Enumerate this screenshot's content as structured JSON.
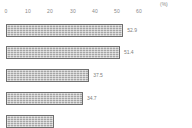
{
  "chart_data": {
    "type": "bar",
    "orientation": "horizontal",
    "title": "",
    "xlabel": "",
    "ylabel": "",
    "unit_label": "(%)",
    "xlim": [
      0,
      60
    ],
    "grid": false,
    "legend": null,
    "axis_position": "top",
    "tick_labels": [
      "0",
      "10",
      "20",
      "30",
      "40",
      "50",
      "60"
    ],
    "tick_values": [
      0,
      10,
      20,
      30,
      40,
      50,
      60
    ],
    "categories": [
      "",
      "",
      "",
      "",
      ""
    ],
    "values": [
      52.9,
      51.4,
      37.5,
      34.7,
      null
    ],
    "value_labels": [
      "52.9",
      "51.4",
      "37.5",
      "34.7",
      ""
    ],
    "bar_color": "#a6a6a6",
    "bar_border_color": "#6f6f6f",
    "label_color": "#7d7d7d",
    "background_color": "#ffffff",
    "note": "fifth bar is cut off at the bottom edge of the image"
  }
}
